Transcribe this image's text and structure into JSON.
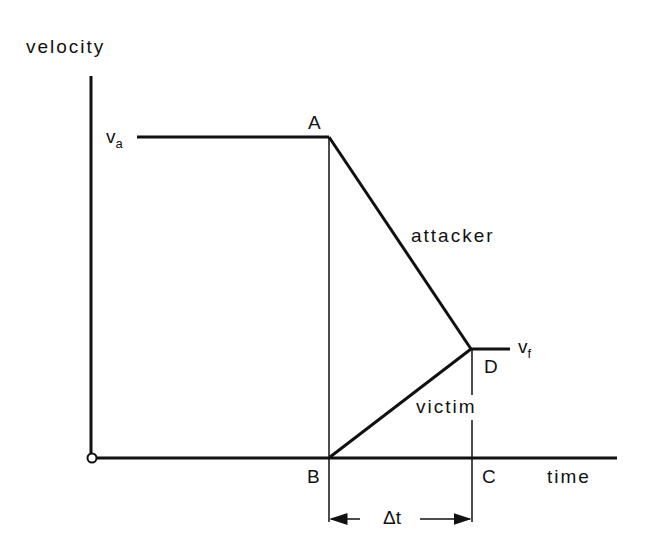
{
  "axes": {
    "y_label": "velocity",
    "x_label": "time"
  },
  "points": {
    "A": "A",
    "B": "B",
    "C": "C",
    "D": "D"
  },
  "velocities": {
    "initial": {
      "base": "v",
      "sub": "a"
    },
    "final": {
      "base": "v",
      "sub": "f"
    }
  },
  "curves": {
    "attacker": "attacker",
    "victim": "victim"
  },
  "interval": "Δt",
  "colors": {
    "ink": "#111111",
    "background": "#ffffff"
  }
}
